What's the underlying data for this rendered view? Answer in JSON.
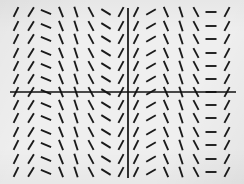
{
  "figure": {
    "kind": "slope-field",
    "caption": "",
    "background_color": "#efefef",
    "ink_color": "#1b1b1b",
    "axis_color": "#111111"
  },
  "axes": {
    "x_axis": {
      "name": "horizontal-axis",
      "pixel_y": 92,
      "x_from": 10,
      "x_to": 236,
      "visible": true
    },
    "y_axis": {
      "name": "vertical-axis",
      "pixel_x": 128,
      "y_from": 8,
      "y_to": 178,
      "visible": true
    },
    "grid": false,
    "tick_labels": [],
    "xlabel": "",
    "ylabel": ""
  },
  "chart_data": {
    "type": "scatter",
    "title": "",
    "xlabel": "",
    "ylabel": "",
    "grid": false,
    "legend": [],
    "note": "Direction field: slope depends only on x, periodic across the plot",
    "tick_length": 11,
    "row_pixel_y": [
      12,
      26,
      39,
      53,
      66,
      79,
      92,
      105,
      118,
      132,
      145,
      159,
      172
    ],
    "columns": [
      {
        "pixel_x": 16,
        "slope_deg": -64,
        "style": "steep-positive"
      },
      {
        "pixel_x": 31,
        "slope_deg": -58,
        "style": "positive"
      },
      {
        "pixel_x": 46,
        "slope_deg": 22,
        "style": "shallow-negative"
      },
      {
        "pixel_x": 61,
        "slope_deg": 68,
        "style": "steep-negative"
      },
      {
        "pixel_x": 76,
        "slope_deg": 72,
        "style": "steep-negative"
      },
      {
        "pixel_x": 91,
        "slope_deg": 62,
        "style": "steep-negative"
      },
      {
        "pixel_x": 106,
        "slope_deg": 32,
        "style": "shallow-negative"
      },
      {
        "pixel_x": 121,
        "slope_deg": -62,
        "style": "steep-positive"
      },
      {
        "pixel_x": 136,
        "slope_deg": -64,
        "style": "steep-positive"
      },
      {
        "pixel_x": 151,
        "slope_deg": -30,
        "style": "shallow-positive"
      },
      {
        "pixel_x": 166,
        "slope_deg": 66,
        "style": "steep-negative"
      },
      {
        "pixel_x": 181,
        "slope_deg": 72,
        "style": "steep-negative"
      },
      {
        "pixel_x": 196,
        "slope_deg": 62,
        "style": "steep-negative"
      },
      {
        "pixel_x": 211,
        "slope_deg": 0,
        "style": "flat"
      },
      {
        "pixel_x": 227,
        "slope_deg": -62,
        "style": "steep-positive"
      }
    ]
  }
}
